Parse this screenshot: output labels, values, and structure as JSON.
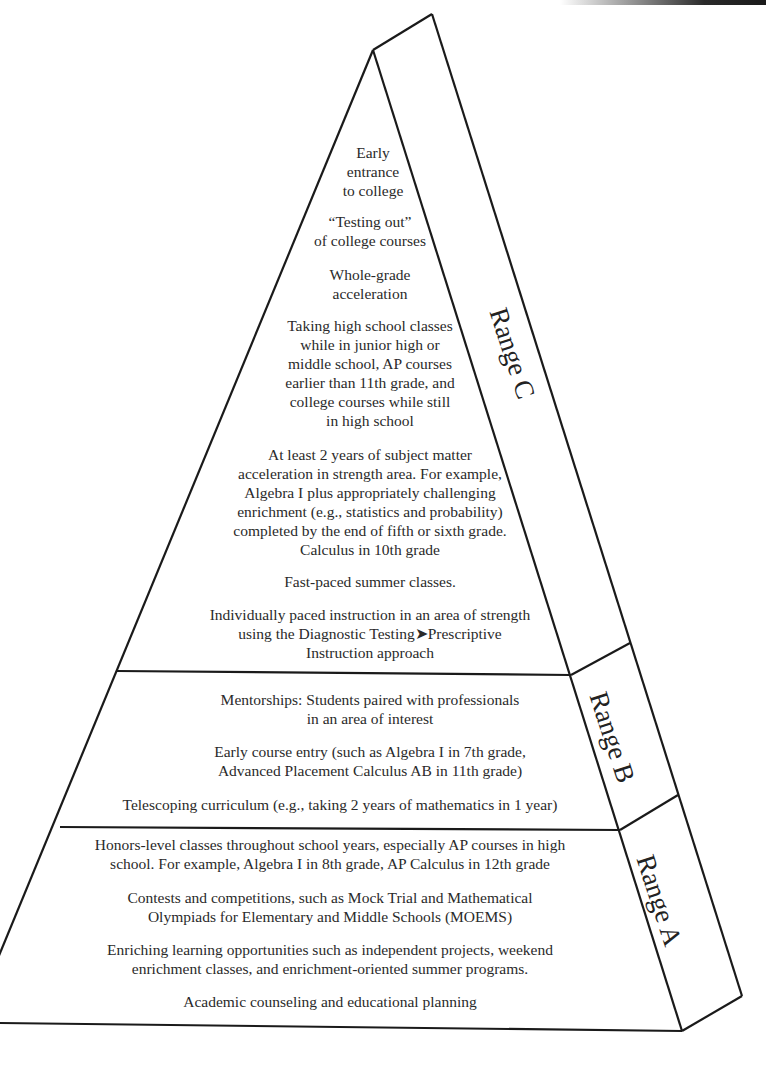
{
  "diagram": {
    "type": "pyramid",
    "line_color": "#1a1a1a",
    "tiers": [
      {
        "label": "Range C",
        "items": [
          [
            "Early",
            "entrance",
            "to college"
          ],
          [
            "“Testing out”",
            "of college courses"
          ],
          [
            "Whole-grade",
            "acceleration"
          ],
          [
            "Taking high school classes",
            "while in junior high or",
            "middle school, AP courses",
            "earlier than 11th grade, and",
            "college courses while still",
            "in high school"
          ],
          [
            "At least 2 years of subject matter",
            "acceleration in strength area. For example,",
            "Algebra I plus appropriately challenging",
            "enrichment (e.g., statistics and probability)",
            "completed by the end of fifth or sixth grade.",
            "Calculus in 10th grade"
          ],
          [
            "Fast-paced summer classes."
          ],
          [
            "Individually paced instruction in an area of strength",
            "using the Diagnostic Testing➤Prescriptive",
            "Instruction approach"
          ]
        ]
      },
      {
        "label": "Range B",
        "items": [
          [
            "Mentorships: Students paired with professionals",
            "in an area of interest"
          ],
          [
            "Early course entry (such as Algebra I in 7th grade,",
            "Advanced Placement Calculus AB in 11th grade)"
          ],
          [
            "Telescoping curriculum (e.g., taking 2 years of mathematics in 1 year)"
          ]
        ]
      },
      {
        "label": "Range A",
        "items": [
          [
            "Honors-level classes throughout school years, especially AP courses in high",
            "school. For example, Algebra I in 8th grade, AP Calculus in 12th grade"
          ],
          [
            "Contests and competitions, such as Mock Trial and Mathematical",
            "Olympiads for Elementary and Middle Schools (MOEMS)"
          ],
          [
            "Enriching learning opportunities such as independent projects, weekend",
            "enrichment classes, and enrichment-oriented summer programs."
          ],
          [
            "Academic counseling and educational planning"
          ]
        ]
      }
    ]
  }
}
